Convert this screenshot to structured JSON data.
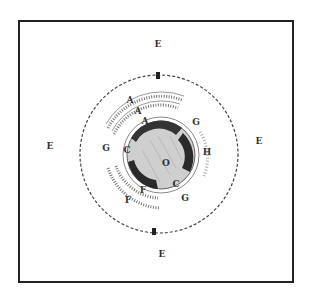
{
  "figure": {
    "type": "scientific-illustration",
    "colors": {
      "ink": "#222222",
      "mid": "#555555",
      "light": "#bbbbbb",
      "paper": "#ffffff"
    },
    "outer_labels": {
      "top": "E",
      "left": "E",
      "right": "E",
      "bottom": "E"
    },
    "ring_markers": {
      "top": "B",
      "bottom": "B"
    },
    "inner_labels": {
      "center": "O",
      "c_left": "C",
      "c_right": "C",
      "c_bottom": "C",
      "d_upper_left": "D",
      "d_lower_right": "D",
      "a_upper_left": "A",
      "a_mid": "A",
      "a_upper": "A",
      "g_left": "G",
      "g_right": "G",
      "f_lower": "F",
      "f_outer": "F",
      "h_right": "H"
    }
  }
}
